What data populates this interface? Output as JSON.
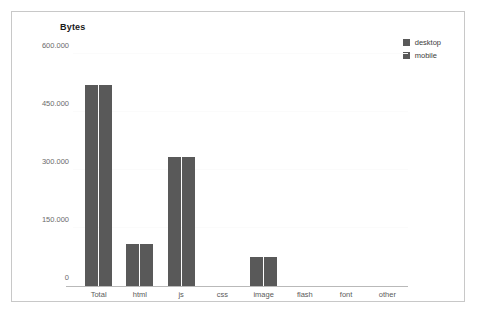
{
  "chart_data": {
    "type": "bar",
    "title": "Bytes",
    "xlabel": "",
    "ylabel": "",
    "categories": [
      "Total",
      "html",
      "js",
      "css",
      "image",
      "flash",
      "font",
      "other"
    ],
    "series": [
      {
        "name": "desktop",
        "values": [
          520000,
          108000,
          334000,
          0,
          75000,
          0,
          0,
          0
        ]
      },
      {
        "name": "mobile",
        "values": [
          520000,
          108000,
          334000,
          0,
          75000,
          0,
          0,
          0
        ]
      }
    ],
    "ylim": [
      0,
      600000
    ],
    "y_ticks": [
      0,
      150000,
      300000,
      450000,
      600000
    ],
    "y_tick_labels": [
      "0",
      "150.000",
      "300.000",
      "450.000",
      "600.000"
    ],
    "grid": true,
    "legend_position": "top-right",
    "colors": {
      "bar": "#595959",
      "gridline": "#fbfbfb",
      "axis": "#b9b9b9",
      "frame": "#c8c8c8",
      "background": "#ffffff",
      "title_text": "#1a1a1a",
      "tick_text": "#6b6b6b"
    }
  },
  "legend": {
    "items": [
      {
        "label": "desktop",
        "color": "#595959"
      },
      {
        "label": "mobile",
        "color": "#595959"
      }
    ]
  }
}
